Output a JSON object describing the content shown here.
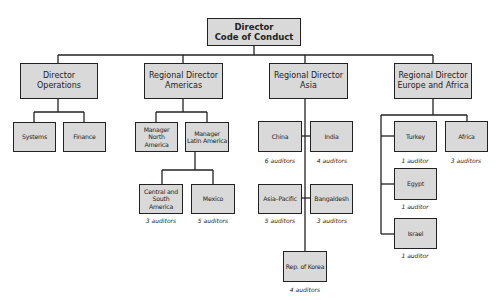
{
  "root": {
    "label": "Director\nCode of Conduct"
  },
  "level1": [
    {
      "label": "Director\nOperations"
    },
    {
      "label": "Regional Director\nAmericas"
    },
    {
      "label": "Regional Director\nAsia"
    },
    {
      "label": "Regional Director\nEurope and Africa"
    }
  ],
  "operations": [
    {
      "label": "Systems"
    },
    {
      "label": "Finance"
    }
  ],
  "americas": [
    {
      "label": "Manager\nNorth America"
    },
    {
      "label": "Manager\nLatin America"
    }
  ],
  "latin_america": [
    {
      "label": "Central and\nSouth America",
      "auditors": "3 auditors"
    },
    {
      "label": "Mexico",
      "auditors": "5 auditors"
    }
  ],
  "asia": [
    {
      "label": "China",
      "auditors": "6 auditors"
    },
    {
      "label": "India",
      "auditors": "4 auditors"
    },
    {
      "label": "Asia–Pacific",
      "auditors": "5 auditors"
    },
    {
      "label": "Bangaldesh",
      "auditors": "3 auditors"
    },
    {
      "label": "Rep. of Korea",
      "auditors": "4 auditors"
    }
  ],
  "europe_africa": [
    {
      "label": "Turkey",
      "auditors": "1 auditor"
    },
    {
      "label": "Africa",
      "auditors": "3 auditors"
    },
    {
      "label": "Egypt",
      "auditors": "1 auditor"
    },
    {
      "label": "Israel",
      "auditors": "1 auditor"
    }
  ],
  "colors": {
    "box_fill": "#d9d9d9",
    "line": "#222222"
  }
}
